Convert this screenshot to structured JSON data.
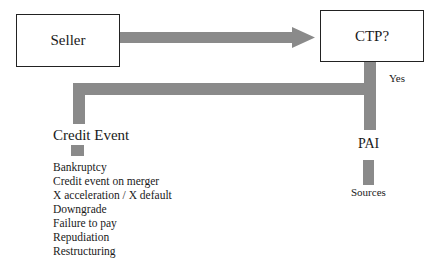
{
  "diagram": {
    "nodes": {
      "seller": "Seller",
      "ctp": "CTP?",
      "credit_event": "Credit Event",
      "pai": "PAI",
      "sources": "Sources"
    },
    "edge_labels": {
      "ctp_yes": "Yes"
    },
    "credit_event_types": [
      "Bankruptcy",
      "Credit event on merger",
      "X acceleration / X default",
      "Downgrade",
      "Failure to pay",
      "Repudiation",
      "Restructuring"
    ],
    "colors": {
      "connector": "#8a8a8a",
      "box_border": "#222222"
    }
  }
}
